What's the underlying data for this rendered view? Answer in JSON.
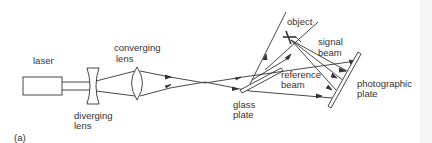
{
  "diagram": {
    "panel_label": "(a)",
    "labels": {
      "laser": "laser",
      "converging_lens_1": "converging",
      "converging_lens_2": "lens",
      "diverging_lens_1": "diverging",
      "diverging_lens_2": "lens",
      "glass_plate_1": "glass",
      "glass_plate_2": "plate",
      "object": "object",
      "signal_beam_1": "signal",
      "signal_beam_2": "beam",
      "reference_beam_1": "reference",
      "reference_beam_2": "beam",
      "photographic_plate_1": "photographic",
      "photographic_plate_2": "plate"
    },
    "colors": {
      "line": "#333333",
      "background": "#ffffff"
    }
  }
}
